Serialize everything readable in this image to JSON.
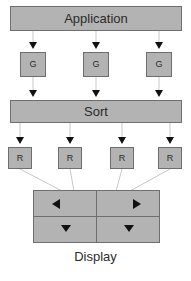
{
  "diagram": {
    "background_color": "#ffffff",
    "node_fill_color": "#b3b3b3",
    "node_border_color": "#6e6e6e",
    "arrow_color": "#111111",
    "text_color": "#2b2b2b",
    "nodes": {
      "application": {
        "label": "Application",
        "x": 10,
        "y": 6,
        "w": 172,
        "h": 25
      },
      "sort": {
        "label": "Sort",
        "x": 10,
        "y": 100,
        "w": 172,
        "h": 23
      },
      "geometry": [
        {
          "label": "G",
          "x": 20,
          "y": 52,
          "w": 26,
          "h": 25
        },
        {
          "label": "G",
          "x": 83,
          "y": 52,
          "w": 26,
          "h": 25
        },
        {
          "label": "G",
          "x": 146,
          "y": 52,
          "w": 26,
          "h": 25
        }
      ],
      "raster": [
        {
          "label": "R",
          "x": 8,
          "y": 147,
          "w": 24,
          "h": 22
        },
        {
          "label": "R",
          "x": 58,
          "y": 147,
          "w": 24,
          "h": 22
        },
        {
          "label": "R",
          "x": 110,
          "y": 147,
          "w": 24,
          "h": 22
        },
        {
          "label": "R",
          "x": 158,
          "y": 147,
          "w": 24,
          "h": 22
        }
      ],
      "display": {
        "label": "Display",
        "x": 33,
        "y": 190,
        "w": 127,
        "h": 53,
        "label_y": 249,
        "quadrants": [
          {
            "name": "top-left",
            "arrow": "left"
          },
          {
            "name": "top-right",
            "arrow": "right"
          },
          {
            "name": "bottom-left",
            "arrow": "down"
          },
          {
            "name": "bottom-right",
            "arrow": "down"
          }
        ]
      }
    },
    "connections": {
      "application_to_geometry": [
        {
          "from_x": 33,
          "from_y": 31,
          "to_x": 33,
          "to_y": 52
        },
        {
          "from_x": 96,
          "from_y": 31,
          "to_x": 96,
          "to_y": 52
        },
        {
          "from_x": 159,
          "from_y": 31,
          "to_x": 159,
          "to_y": 52
        }
      ],
      "geometry_to_sort": [
        {
          "from_x": 33,
          "from_y": 77,
          "to_x": 33,
          "to_y": 100
        },
        {
          "from_x": 96,
          "from_y": 77,
          "to_x": 96,
          "to_y": 100
        },
        {
          "from_x": 159,
          "from_y": 77,
          "to_x": 159,
          "to_y": 100
        }
      ],
      "sort_to_raster": [
        {
          "from_x": 20,
          "from_y": 123,
          "to_x": 20,
          "to_y": 147
        },
        {
          "from_x": 70,
          "from_y": 123,
          "to_x": 70,
          "to_y": 147
        },
        {
          "from_x": 122,
          "from_y": 123,
          "to_x": 122,
          "to_y": 147
        },
        {
          "from_x": 170,
          "from_y": 123,
          "to_x": 170,
          "to_y": 147
        }
      ],
      "raster_to_display": [
        {
          "from_x": 20,
          "from_y": 169,
          "to_x": 62,
          "to_y": 190
        },
        {
          "from_x": 70,
          "from_y": 169,
          "to_x": 74,
          "to_y": 190
        },
        {
          "from_x": 122,
          "from_y": 169,
          "to_x": 116,
          "to_y": 190
        },
        {
          "from_x": 170,
          "from_y": 169,
          "to_x": 130,
          "to_y": 190
        }
      ]
    }
  }
}
